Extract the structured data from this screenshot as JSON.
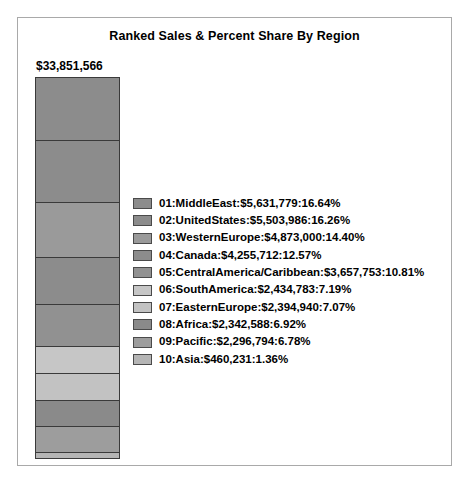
{
  "chart": {
    "title": "Ranked Sales & Percent Share By Region",
    "total_label": "$33,851,566"
  },
  "chart_data": {
    "type": "bar",
    "subtype": "stacked-single-bar",
    "title": "Ranked Sales & Percent Share By Region",
    "xlabel": "",
    "ylabel": "",
    "total_value": 33851566,
    "total_label": "$33,851,566",
    "value_unit": "USD",
    "grid": false,
    "legend_position": "right",
    "categories": [
      "01:MiddleEast",
      "02:UnitedStates",
      "03:WesternEurope",
      "04:Canada",
      "05:CentralAmerica/Caribbean",
      "06:SouthAmerica",
      "07:EasternEurope",
      "08:Africa",
      "09:Pacific",
      "10:Asia"
    ],
    "values": [
      5631779,
      5503986,
      4873000,
      4255712,
      3657753,
      2434783,
      2394940,
      2342588,
      2296794,
      460231
    ],
    "percents": [
      16.64,
      16.26,
      14.4,
      12.57,
      10.81,
      7.19,
      7.07,
      6.92,
      6.78,
      1.36
    ],
    "colors": [
      "#8c8c8c",
      "#8c8c8c",
      "#9a9a9a",
      "#8c8c8c",
      "#919191",
      "#c6c6c6",
      "#c2c2c2",
      "#8a8a8a",
      "#9d9d9d",
      "#b5b5b5"
    ],
    "segments": [
      {
        "rank": "01",
        "region": "MiddleEast",
        "value": "$5,631,779",
        "percent": "16.64%",
        "pct": 16.64,
        "color": "#8c8c8c",
        "legend": "01:MiddleEast:$5,631,779:16.64%"
      },
      {
        "rank": "02",
        "region": "UnitedStates",
        "value": "$5,503,986",
        "percent": "16.26%",
        "pct": 16.26,
        "color": "#8c8c8c",
        "legend": "02:UnitedStates:$5,503,986:16.26%"
      },
      {
        "rank": "03",
        "region": "WesternEurope",
        "value": "$4,873,000",
        "percent": "14.40%",
        "pct": 14.4,
        "color": "#9a9a9a",
        "legend": "03:WesternEurope:$4,873,000:14.40%"
      },
      {
        "rank": "04",
        "region": "Canada",
        "value": "$4,255,712",
        "percent": "12.57%",
        "pct": 12.57,
        "color": "#8c8c8c",
        "legend": "04:Canada:$4,255,712:12.57%"
      },
      {
        "rank": "05",
        "region": "CentralAmerica/Caribbean",
        "value": "$3,657,753",
        "percent": "10.81%",
        "pct": 10.81,
        "color": "#919191",
        "legend": "05:CentralAmerica/Caribbean:$3,657,753:10.81%"
      },
      {
        "rank": "06",
        "region": "SouthAmerica",
        "value": "$2,434,783",
        "percent": "7.19%",
        "pct": 7.19,
        "color": "#c6c6c6",
        "legend": "06:SouthAmerica:$2,434,783:7.19%"
      },
      {
        "rank": "07",
        "region": "EasternEurope",
        "value": "$2,394,940",
        "percent": "7.07%",
        "pct": 7.07,
        "color": "#c2c2c2",
        "legend": "07:EasternEurope:$2,394,940:7.07%"
      },
      {
        "rank": "08",
        "region": "Africa",
        "value": "$2,342,588",
        "percent": "6.92%",
        "pct": 6.92,
        "color": "#8a8a8a",
        "legend": "08:Africa:$2,342,588:6.92%"
      },
      {
        "rank": "09",
        "region": "Pacific",
        "value": "$2,296,794",
        "percent": "6.78%",
        "pct": 6.78,
        "color": "#9d9d9d",
        "legend": "09:Pacific:$2,296,794:6.78%"
      },
      {
        "rank": "10",
        "region": "Asia",
        "value": "$460,231",
        "percent": "1.36%",
        "pct": 1.36,
        "color": "#b5b5b5",
        "legend": "10:Asia:$460,231:1.36%"
      }
    ]
  }
}
